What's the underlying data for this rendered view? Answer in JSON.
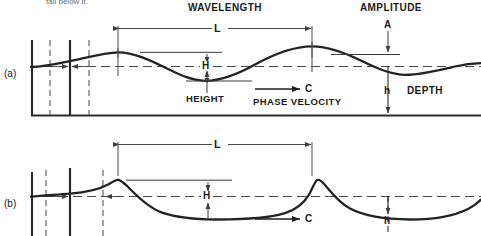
{
  "figure": {
    "cut_off_text_top": "fall below it.",
    "panels": [
      {
        "id": "a",
        "caption": "(a)",
        "wave_type": "sinusoidal",
        "labels": {
          "wavelength_title": "WAVELENGTH",
          "wavelength_symbol": "L",
          "amplitude_title": "AMPLITUDE",
          "amplitude_symbol": "A",
          "height_title": "HEIGHT",
          "height_symbol": "H",
          "depth_title": "DEPTH",
          "depth_symbol": "h",
          "velocity_title": "PHASE VELOCITY",
          "velocity_symbol": "C"
        }
      },
      {
        "id": "b",
        "caption": "(b)",
        "wave_type": "cnoidal",
        "labels": {
          "wavelength_symbol": "L",
          "height_symbol": "H",
          "depth_symbol": "h",
          "velocity_symbol": "C"
        }
      }
    ],
    "colors": {
      "ink": "#1a1a1a",
      "wave_stroke": "#232323",
      "dimension_line": "#4a4a4a",
      "dashed_line": "#555555",
      "background": "#ffffff"
    }
  }
}
